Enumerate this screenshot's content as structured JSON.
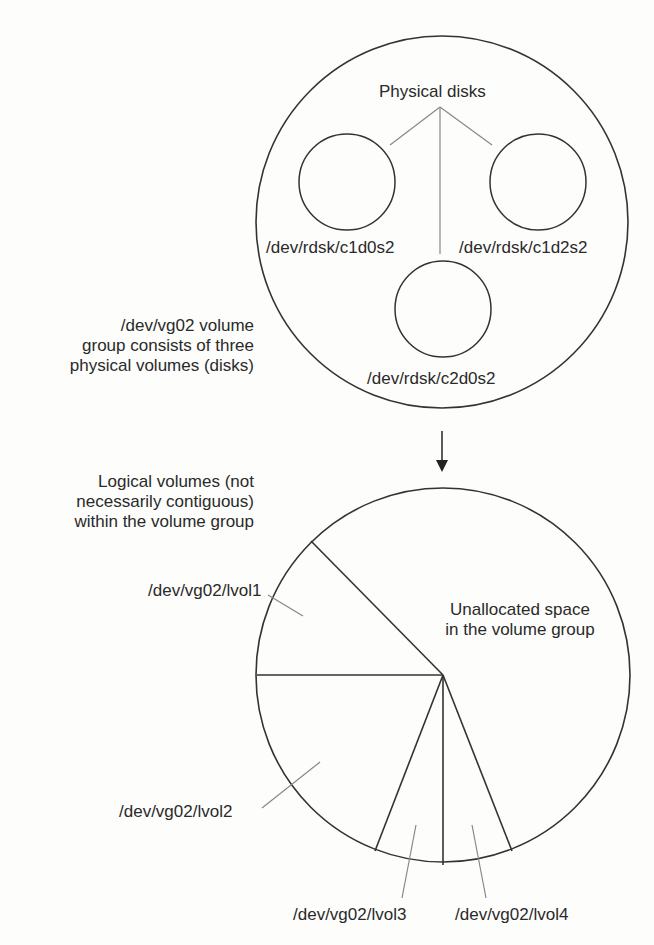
{
  "volume_group": {
    "title": "Physical disks",
    "description_lines": [
      "/dev/vg02 volume",
      "group consists of three",
      "physical volumes (disks)"
    ],
    "disks": [
      {
        "name": "/dev/rdsk/c1d0s2"
      },
      {
        "name": "/dev/rdsk/c1d2s2"
      },
      {
        "name": "/dev/rdsk/c2d0s2"
      }
    ]
  },
  "logical_view": {
    "description_lines": [
      "Logical volumes (not",
      "necessarily contiguous)",
      "within the volume group"
    ],
    "unallocated_lines": [
      "Unallocated space",
      "in the volume group"
    ],
    "volumes": [
      {
        "name": "/dev/vg02/lvol1"
      },
      {
        "name": "/dev/vg02/lvol2"
      },
      {
        "name": "/dev/vg02/lvol3"
      },
      {
        "name": "/dev/vg02/lvol4"
      }
    ]
  },
  "colors": {
    "stroke": "#333333",
    "leader": "#888888",
    "background": "#fdfdfb"
  }
}
